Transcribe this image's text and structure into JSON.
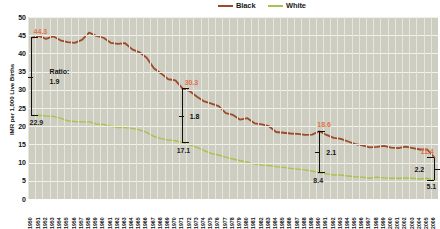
{
  "chart_data": {
    "type": "line",
    "title": "",
    "xlabel": "",
    "ylabel": "IMR per 1,000 Live Births",
    "ylim": [
      0,
      50
    ],
    "yticks": [
      0,
      5,
      10,
      15,
      20,
      25,
      30,
      35,
      40,
      45,
      50
    ],
    "grid": true,
    "legend_position": "top-center",
    "x": [
      1950,
      1951,
      1952,
      1953,
      1954,
      1955,
      1956,
      1957,
      1958,
      1959,
      1960,
      1961,
      1962,
      1963,
      1964,
      1965,
      1966,
      1967,
      1968,
      1969,
      1970,
      1971,
      1972,
      1973,
      1974,
      1975,
      1976,
      1977,
      1978,
      1979,
      1980,
      1981,
      1982,
      1983,
      1984,
      1985,
      1986,
      1987,
      1988,
      1989,
      1990,
      1991,
      1992,
      1993,
      1994,
      1995,
      1996,
      1997,
      1998,
      1999,
      2000,
      2001,
      2002,
      2003,
      2004,
      2005,
      2006
    ],
    "series": [
      {
        "name": "Black",
        "color": "#9C4A2A",
        "values": [
          44.3,
          44.8,
          44.0,
          44.7,
          43.6,
          43.1,
          42.9,
          43.7,
          45.7,
          44.8,
          44.3,
          42.9,
          42.6,
          42.8,
          41.1,
          40.3,
          38.8,
          35.9,
          34.5,
          32.9,
          32.6,
          30.3,
          29.6,
          28.1,
          26.8,
          26.2,
          25.5,
          23.6,
          23.1,
          21.8,
          22.2,
          20.8,
          20.5,
          20.0,
          18.4,
          18.2,
          18.0,
          17.9,
          17.6,
          17.7,
          18.6,
          17.6,
          16.8,
          16.5,
          15.8,
          15.1,
          14.7,
          14.2,
          14.3,
          14.6,
          14.1,
          14.0,
          14.4,
          14.0,
          13.6,
          13.6,
          11.4
        ]
      },
      {
        "name": "White",
        "color": "#A9C24C",
        "values": [
          22.9,
          23.0,
          22.8,
          22.7,
          22.2,
          21.5,
          21.3,
          21.2,
          21.2,
          20.6,
          20.5,
          20.0,
          19.6,
          19.6,
          19.4,
          19.0,
          18.3,
          17.2,
          16.6,
          16.2,
          16.0,
          15.5,
          14.8,
          14.2,
          13.3,
          12.5,
          12.1,
          11.5,
          11.0,
          10.5,
          10.1,
          9.6,
          9.3,
          9.2,
          8.9,
          8.7,
          8.4,
          8.2,
          8.0,
          7.7,
          7.2,
          6.9,
          6.6,
          6.6,
          6.3,
          6.1,
          6.0,
          5.7,
          6.0,
          5.8,
          5.7,
          5.7,
          5.8,
          5.7,
          5.5,
          5.7,
          5.1
        ]
      }
    ],
    "annotations": [
      {
        "name": "black-value-1950",
        "text": "44.3",
        "series": "Black",
        "x": 1950,
        "value": 44.3,
        "color": "#e0714a"
      },
      {
        "name": "white-value-1950",
        "text": "22.9",
        "series": "White",
        "x": 1950,
        "value": 22.9,
        "color": "#222222"
      },
      {
        "name": "ratio-word-1950",
        "text": "Ratio:",
        "x": 1950
      },
      {
        "name": "ratio-value-1950",
        "text": "1.9",
        "x": 1950,
        "value": 1.9
      },
      {
        "name": "black-value-1971",
        "text": "30.3",
        "series": "Black",
        "x": 1971,
        "value": 30.3,
        "color": "#e0714a"
      },
      {
        "name": "white-value-1971",
        "text": "17.1",
        "series": "White",
        "x": 1971,
        "value": 17.1,
        "color": "#222222"
      },
      {
        "name": "ratio-value-1971",
        "text": "1.8",
        "x": 1971,
        "value": 1.8
      },
      {
        "name": "black-value-1990",
        "text": "18.6",
        "series": "Black",
        "x": 1990,
        "value": 18.6,
        "color": "#e0714a"
      },
      {
        "name": "white-value-1990",
        "text": "8.4",
        "series": "White",
        "x": 1990,
        "value": 8.4,
        "color": "#222222"
      },
      {
        "name": "ratio-value-1990",
        "text": "2.1",
        "x": 1990,
        "value": 2.1
      },
      {
        "name": "black-value-2006",
        "text": "11.4",
        "series": "Black",
        "x": 2006,
        "value": 11.4,
        "color": "#e0714a"
      },
      {
        "name": "white-value-2006",
        "text": "5.1",
        "series": "White",
        "x": 2006,
        "value": 5.1,
        "color": "#222222"
      },
      {
        "name": "ratio-value-2006",
        "text": "2.2",
        "x": 2006,
        "value": 2.2
      }
    ]
  },
  "legend": {
    "items": [
      {
        "label": "Black",
        "color": "#9C4A2A"
      },
      {
        "label": "White",
        "color": "#A9C24C"
      }
    ]
  },
  "colors": {
    "plot_background": "#cdcdc2",
    "gridline": "#f2f2ec",
    "black_series": "#9C4A2A",
    "white_series": "#A9C24C",
    "annotation_black": "#e0714a",
    "annotation_white": "#222222"
  }
}
